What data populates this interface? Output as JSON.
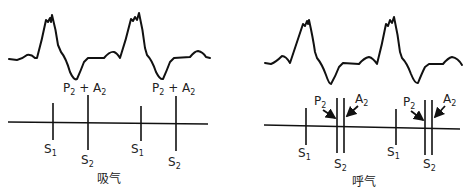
{
  "panels": [
    {
      "id": "inspiration",
      "caption": "吸气",
      "combined_label": {
        "main": "P",
        "sub1": "2",
        "plus": " + A",
        "sub2": "2"
      },
      "s1_label": {
        "main": "S",
        "sub": "1"
      },
      "s2_label": {
        "main": "S",
        "sub": "2"
      }
    },
    {
      "id": "expiration",
      "caption": "呼气",
      "p2_label": {
        "main": "P",
        "sub": "2"
      },
      "a2_label": {
        "main": "A",
        "sub": "2"
      },
      "s1_label": {
        "main": "S",
        "sub": "1"
      },
      "s2_label": {
        "main": "S",
        "sub": "2"
      }
    }
  ],
  "colors": {
    "ink": "#111111",
    "background": "#ffffff"
  }
}
